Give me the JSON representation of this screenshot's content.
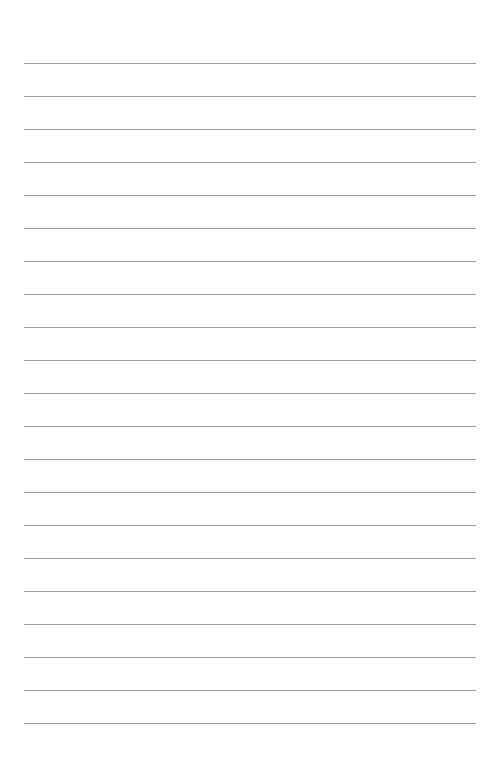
{
  "page": {
    "type": "lined-paper",
    "background_color": "#ffffff",
    "line_color": "#9c9c9c",
    "line_count": 21,
    "first_line_y": 63,
    "line_spacing": 33,
    "line_left": 24,
    "line_width": 452
  }
}
